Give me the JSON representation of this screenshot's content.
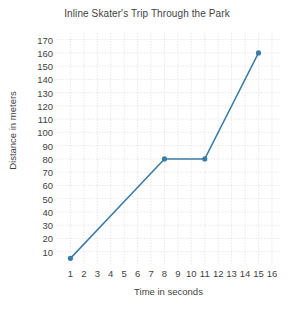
{
  "chart_data": {
    "type": "line",
    "title": "Inline Skater's Trip Through the Park",
    "xlabel": "Time in seconds",
    "ylabel": "Distance in meters",
    "x": [
      1,
      8,
      11,
      15
    ],
    "values": [
      5,
      80,
      80,
      160
    ],
    "points": [
      {
        "x": 1,
        "y": 5
      },
      {
        "x": 8,
        "y": 80
      },
      {
        "x": 11,
        "y": 80
      },
      {
        "x": 15,
        "y": 160
      }
    ],
    "xlim": [
      0,
      16.6
    ],
    "ylim": [
      0,
      175
    ],
    "xticks": [
      1,
      2,
      3,
      4,
      5,
      6,
      7,
      8,
      9,
      10,
      11,
      12,
      13,
      14,
      15,
      16
    ],
    "yticks": [
      10,
      20,
      30,
      40,
      50,
      60,
      70,
      80,
      90,
      100,
      110,
      120,
      130,
      140,
      150,
      160,
      170
    ],
    "xtick_labels": [
      "1",
      "2",
      "3",
      "4",
      "5",
      "6",
      "7",
      "8",
      "9",
      "10",
      "11",
      "12",
      "13",
      "14",
      "15",
      "16"
    ],
    "ytick_labels": [
      "10",
      "20",
      "30",
      "40",
      "50",
      "60",
      "70",
      "80",
      "90",
      "100",
      "110",
      "120",
      "130",
      "140",
      "150",
      "160",
      "170"
    ],
    "grid": true,
    "legend": null,
    "series_color": "#3a7ca5",
    "grid_color": "#d8d8d8",
    "marker": "circle",
    "marker_size": 4
  }
}
